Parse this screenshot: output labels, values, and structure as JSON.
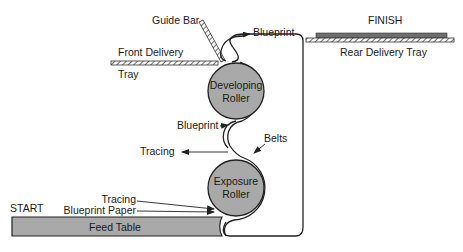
{
  "diagram": {
    "type": "blueprint machine paper path schematic",
    "labels": {
      "guide_bar": "Guide Bar",
      "front_delivery": "Front Delivery",
      "tray": "Tray",
      "blueprint_top": "Blueprint",
      "finish": "FINISH",
      "rear_delivery_tray": "Rear Delivery Tray",
      "developing_roller_line1": "Developing",
      "developing_roller_line2": "Roller",
      "blueprint_mid": "Blueprint",
      "belts": "Belts",
      "tracing_out": "Tracing",
      "exposure_roller_line1": "Exposure",
      "exposure_roller_line2": "Roller",
      "start": "START",
      "tracing_in": "Tracing",
      "blueprint_paper": "Blueprint Paper",
      "feed_table": "Feed Table"
    },
    "colors": {
      "roller_fill": "#a9a9a9",
      "line": "#222222",
      "tray_stack": "#6e6e6e"
    }
  }
}
